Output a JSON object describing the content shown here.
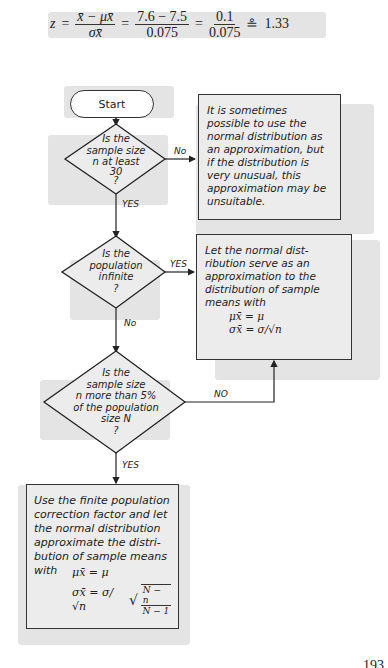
{
  "formula": {
    "lhs": "z",
    "eq1": "=",
    "frac1_num": "x̄ − μx̄",
    "frac1_den": "σx̄",
    "eq2": "=",
    "frac2_num": "7.6 − 7.5",
    "frac2_den": "0.075",
    "eq3": "=",
    "frac3_num": "0.1",
    "frac3_den": "0.075",
    "approx": "≗",
    "result": "1.33"
  },
  "flowchart": {
    "start": "Start",
    "decision1": {
      "lines": [
        "Is the",
        "sample size",
        "n at least",
        "30",
        "?"
      ]
    },
    "decision1_no_label": "No",
    "decision1_yes_label": "YES",
    "note1": "It is sometimes possible to use the normal distribution as an approximation, but if the distribution is very unusual, this approximation may be unsuitable.",
    "decision2": {
      "lines": [
        "Is the",
        "population",
        "infinite",
        "?"
      ]
    },
    "decision2_yes_label": "YES",
    "decision2_no_label": "No",
    "result_infinite": {
      "text": "Let the normal dist-ribution serve as an approximation to the distribution of sample means with",
      "formula_mean": "μx̄ = μ",
      "formula_sd": "σx̄ = σ/√n"
    },
    "decision3": {
      "lines": [
        "Is the",
        "sample size",
        "n more than 5%",
        "of the population",
        "size N",
        "?"
      ]
    },
    "decision3_no_label": "NO",
    "decision3_yes_label": "YES",
    "result_finite": {
      "text": "Use the finite population correction factor and let the normal distribution approximate the distri-bution of sample means with",
      "formula_mean": "μx̄ = μ",
      "formula_sd_lhs": "σx̄ = σ/√n",
      "formula_sd_sqrt_num": "N − n",
      "formula_sd_sqrt_den": "N − 1"
    }
  },
  "page_number": "193"
}
